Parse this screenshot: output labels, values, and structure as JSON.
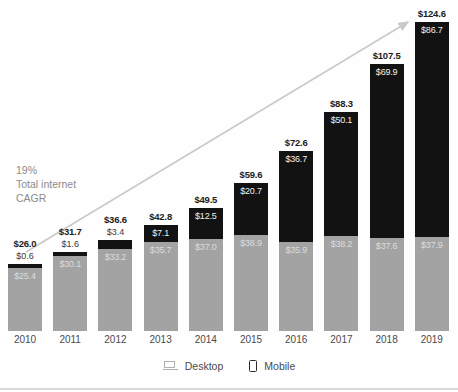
{
  "chart_data": {
    "type": "bar",
    "subtype": "stacked-bar",
    "title": "",
    "xlabel": "",
    "ylabel": "",
    "categories": [
      "2010",
      "2011",
      "2012",
      "2013",
      "2014",
      "2015",
      "2016",
      "2017",
      "2018",
      "2019"
    ],
    "series": [
      {
        "name": "Desktop",
        "color": "#a3a3a3",
        "values": [
          25.4,
          30.1,
          33.2,
          35.7,
          37.0,
          38.9,
          35.9,
          38.2,
          37.6,
          37.9
        ],
        "labels": [
          "$25.4",
          "$30.1",
          "$33.2",
          "$35.7",
          "$37.0",
          "$38.9",
          "$35.9",
          "$38.2",
          "$37.6",
          "$37.9"
        ]
      },
      {
        "name": "Mobile",
        "color": "#121212",
        "values": [
          0.6,
          1.6,
          3.4,
          7.1,
          12.5,
          20.7,
          36.7,
          50.1,
          69.9,
          86.7
        ],
        "labels": [
          "$0.6",
          "$1.6",
          "$3.4",
          "$7.1",
          "$12.5",
          "$20.7",
          "$36.7",
          "$50.1",
          "$69.9",
          "$86.7"
        ]
      }
    ],
    "totals": [
      26.0,
      31.7,
      36.6,
      42.8,
      49.5,
      59.6,
      72.6,
      88.3,
      107.5,
      124.6
    ],
    "total_labels": [
      "$26.0",
      "$31.7",
      "$36.6",
      "$42.8",
      "$49.5",
      "$59.6",
      "$72.6",
      "$88.3",
      "$107.5",
      "$124.6"
    ],
    "ylim": [
      0,
      124.6
    ],
    "grid": false,
    "legend": {
      "position": "bottom",
      "entries": [
        {
          "label": "Desktop",
          "icon": "laptop-icon",
          "color": "#a3a3a3"
        },
        {
          "label": "Mobile",
          "icon": "phone-icon",
          "color": "#121212"
        }
      ]
    },
    "annotations": [
      {
        "name": "cagr-annotation",
        "text": "19%\nTotal internet\nCAGR",
        "lines": [
          "19%",
          "Total internet",
          "CAGR"
        ],
        "color": "#8c8c8c"
      },
      {
        "name": "trend-arrow",
        "type": "arrow",
        "color": "#c9c9c9",
        "from": "2010",
        "to": "2019"
      }
    ]
  },
  "legend": {
    "desktop_label": "Desktop",
    "mobile_label": "Mobile"
  },
  "cagr": {
    "line1": "19%",
    "line2": "Total internet",
    "line3": "CAGR"
  }
}
